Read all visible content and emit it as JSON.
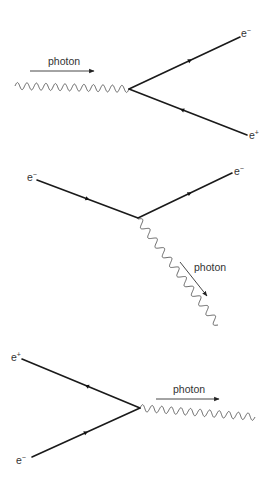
{
  "diagrams": [
    {
      "name": "pair-production",
      "photon_label": "photon",
      "particles": [
        {
          "label": "e",
          "charge": "−"
        },
        {
          "label": "e",
          "charge": "+"
        }
      ]
    },
    {
      "name": "photon-emission",
      "photon_label": "photon",
      "particles": [
        {
          "label": "e",
          "charge": "−"
        },
        {
          "label": "e",
          "charge": "−"
        }
      ]
    },
    {
      "name": "annihilation",
      "photon_label": "photon",
      "particles": [
        {
          "label": "e",
          "charge": "+"
        },
        {
          "label": "e",
          "charge": "−"
        }
      ]
    }
  ],
  "colors": {
    "fermion_line": "#1a1a1a",
    "photon_line": "#555555",
    "text": "#333333",
    "background": "#ffffff"
  }
}
